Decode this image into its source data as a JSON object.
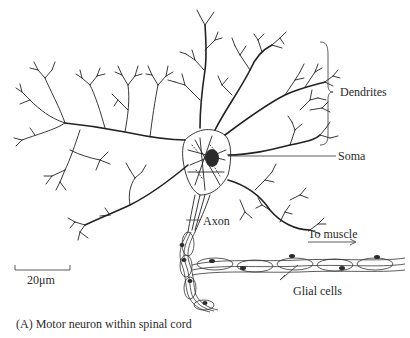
{
  "figure": {
    "caption": "(A) Motor neuron within spinal cord",
    "labels": {
      "dendrites": "Dendrites",
      "soma": "Soma",
      "axon": "Axon",
      "to_muscle": "To muscle",
      "glial_cells": "Glial cells"
    },
    "scale_bar": {
      "label": "20μm"
    }
  },
  "colors": {
    "line": "#222222",
    "background": "#ffffff"
  }
}
